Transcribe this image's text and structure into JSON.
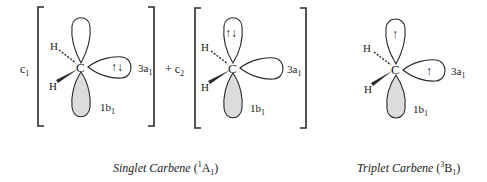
{
  "diagram": {
    "singlet": {
      "coefficients": [
        "c",
        "c"
      ],
      "coefficient_subscripts": [
        "1",
        "2"
      ],
      "plus_sign": "+",
      "structures": [
        {
          "atom": "C",
          "substituents": [
            "H",
            "H"
          ],
          "orbital_labels": {
            "a1": "3a",
            "a1_sub": "1",
            "b1": "1b",
            "b1_sub": "1"
          },
          "electrons_in": "3a1",
          "electron_glyph": "↑↓"
        },
        {
          "atom": "C",
          "substituents": [
            "H",
            "H"
          ],
          "orbital_labels": {
            "a1": "3a",
            "a1_sub": "1",
            "b1": "1b",
            "b1_sub": "1"
          },
          "electrons_in": "top lobe",
          "electron_glyph": "↑↓"
        }
      ],
      "caption_name": "Singlet Carbene",
      "caption_sup": "1",
      "caption_term": "A",
      "caption_sub": "1"
    },
    "triplet": {
      "atom": "C",
      "substituents": [
        "H",
        "H"
      ],
      "orbital_labels": {
        "a1": "3a",
        "a1_sub": "1",
        "b1": "1b",
        "b1_sub": "1"
      },
      "electron_glyph_top": "↑",
      "electron_glyph_right": "↑",
      "caption_name": "Triplet Carbene",
      "caption_sup": "3",
      "caption_term": "B",
      "caption_sub": "1"
    },
    "colors": {
      "line": "#2a2a2a",
      "shade": "#dcdcdc",
      "background": "#ffffff"
    }
  }
}
